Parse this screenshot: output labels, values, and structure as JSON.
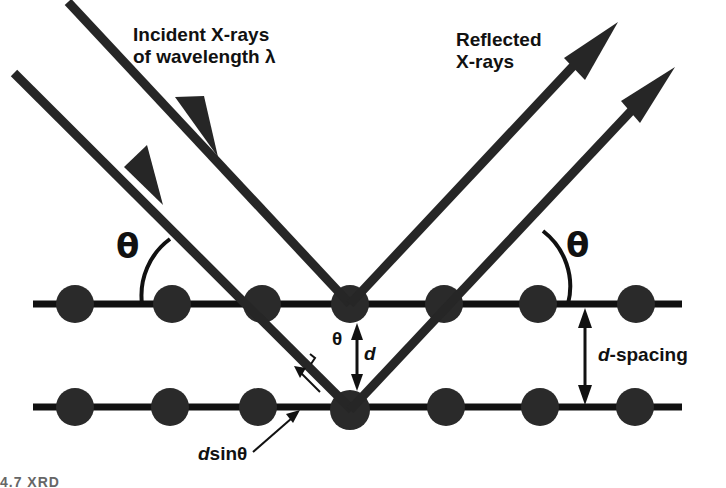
{
  "labels": {
    "incident_line1": "Incident X-rays",
    "incident_line2": "of wavelength λ",
    "reflected_line1": "Reflected",
    "reflected_line2": "X-rays",
    "theta_left": "θ",
    "theta_right": "θ",
    "theta_center": "θ",
    "d_center": "d",
    "d_spacing_d": "d",
    "d_spacing_rest": "-spacing",
    "dsin_d": "d",
    "dsin_rest": "sinθ"
  },
  "caption": "4.7  XRD",
  "colors": {
    "ink": "#111111",
    "atom": "#2a2a2a",
    "ray": "#262626",
    "background": "#ffffff"
  },
  "lattice": {
    "top_row_y": 304,
    "bottom_row_y": 407,
    "line_x_start": 33,
    "line_x_end": 682,
    "atom_x": [
      75,
      172,
      262,
      350,
      444,
      538,
      636
    ],
    "atom_radius": 19
  }
}
